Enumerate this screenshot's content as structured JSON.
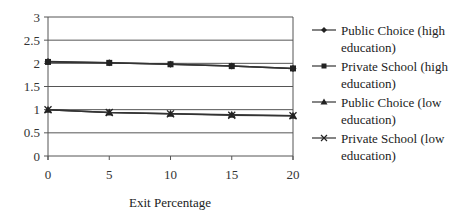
{
  "chart_data": {
    "type": "line",
    "title": "",
    "xlabel": "Exit Percentage",
    "ylabel": "",
    "x": [
      0,
      5,
      10,
      15,
      20
    ],
    "xticks": [
      "0",
      "5",
      "10",
      "15",
      "20"
    ],
    "yticks": [
      "0",
      "0.5",
      "1",
      "1.5",
      "2",
      "2.5",
      "3"
    ],
    "ylim": [
      0,
      3
    ],
    "xlim": [
      0,
      20
    ],
    "grid": "horizontal",
    "legend_position": "right",
    "series": [
      {
        "name": "Public Choice (high education)",
        "marker": "diamond",
        "values": [
          2.04,
          2.01,
          1.98,
          1.94,
          1.89
        ]
      },
      {
        "name": "Private School (high education)",
        "marker": "square",
        "values": [
          2.03,
          2.01,
          1.98,
          1.94,
          1.89
        ]
      },
      {
        "name": "Public Choice (low education)",
        "marker": "triangle",
        "values": [
          1.0,
          0.94,
          0.91,
          0.89,
          0.87
        ]
      },
      {
        "name": "Private School (low education)",
        "marker": "x",
        "values": [
          1.0,
          0.94,
          0.91,
          0.88,
          0.87
        ]
      }
    ]
  },
  "legend": {
    "items": [
      {
        "line1": "Public Choice (high",
        "line2": "education)"
      },
      {
        "line1": "Private School (high",
        "line2": "education)"
      },
      {
        "line1": "Public Choice (low",
        "line2": "education)"
      },
      {
        "line1": "Private School (low",
        "line2": "education)"
      }
    ]
  },
  "colors": {
    "line": "#333333",
    "grid": "#555555",
    "axis": "#555555"
  }
}
